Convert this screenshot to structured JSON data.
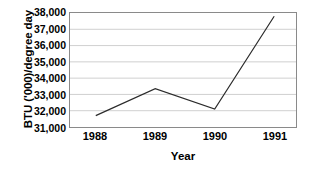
{
  "chart_data": {
    "type": "line",
    "title": "",
    "xlabel": "Year",
    "ylabel": "BTU ('000)/degree day",
    "categories": [
      "1988",
      "1989",
      "1990",
      "1991"
    ],
    "x": [
      1988,
      1989,
      1990,
      1991
    ],
    "values": [
      31700,
      33350,
      32100,
      37800
    ],
    "series": [
      {
        "name": "BTU per degree day",
        "values": [
          31700,
          33350,
          32100,
          37800
        ]
      }
    ],
    "ylim": [
      31000,
      38000
    ],
    "ytick_step": 1000,
    "ytick_labels": [
      "38,000",
      "37,000",
      "36,000",
      "35,000",
      "34,000",
      "33,000",
      "32,000",
      "31,000"
    ],
    "ytick_values": [
      38000,
      37000,
      36000,
      35000,
      34000,
      33000,
      32000,
      31000
    ],
    "xtick_labels": [
      "1988",
      "1989",
      "1990",
      "1991"
    ],
    "grid": true,
    "grid_axis": "y",
    "legend": false,
    "legend_position": "none",
    "line_color": "#2b2b2b",
    "grid_color": "#cfcfcf",
    "frame_color": "#8a8a8a",
    "background_color": "#ffffff",
    "markers": false
  }
}
